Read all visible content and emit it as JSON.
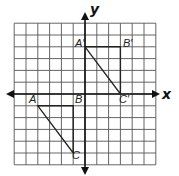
{
  "figure": {
    "axes": {
      "x_label": "x",
      "y_label": "y"
    },
    "grid": {
      "x_min": -6,
      "x_max": 6,
      "y_min": -6,
      "y_max": 6,
      "step": 1
    },
    "triangles": [
      {
        "name": "ABC",
        "vertices": [
          {
            "label": "A",
            "x": -4,
            "y": -1
          },
          {
            "label": "B",
            "x": -1,
            "y": -1
          },
          {
            "label": "C",
            "x": -1,
            "y": -5
          }
        ]
      },
      {
        "name": "A'B'C'",
        "vertices": [
          {
            "label": "A′",
            "x": 0,
            "y": 4
          },
          {
            "label": "B′",
            "x": 3,
            "y": 4
          },
          {
            "label": "C′",
            "x": 3,
            "y": 0
          }
        ]
      }
    ],
    "colors": {
      "grid": "#555555",
      "axis": "#111111",
      "triangle": "#222222"
    }
  }
}
